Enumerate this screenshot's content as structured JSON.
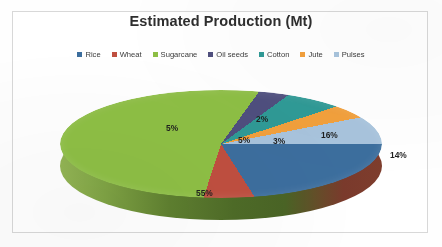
{
  "chart_data": {
    "type": "pie",
    "title": "Estimated Production (Mt)",
    "categories": [
      "Rice",
      "Wheat",
      "Sugarcane",
      "Oil seeds",
      "Cotton",
      "Jute",
      "Pulses"
    ],
    "values": [
      16,
      14,
      55,
      5,
      5,
      2,
      3
    ],
    "value_labels": [
      "16%",
      "14%",
      "55%",
      "5%",
      "5%",
      "2%",
      "3%"
    ],
    "unit": "%",
    "colors": [
      "#3c6e9e",
      "#bf4f40",
      "#8ebf45",
      "#4f4f7e",
      "#2f9a96",
      "#f2a03c",
      "#a8c4dd"
    ],
    "legend_position": "top",
    "three_d": true,
    "xlabel": "",
    "ylabel": "",
    "grid": false
  },
  "legend": {
    "items": [
      {
        "label": "Rice",
        "color": "#3c6e9e"
      },
      {
        "label": "Wheat",
        "color": "#bf4f40"
      },
      {
        "label": "Sugarcane",
        "color": "#8ebf45"
      },
      {
        "label": "Oil seeds",
        "color": "#4f4f7e"
      },
      {
        "label": "Cotton",
        "color": "#2f9a96"
      },
      {
        "label": "Jute",
        "color": "#f2a03c"
      },
      {
        "label": "Pulses",
        "color": "#a8c4dd"
      }
    ]
  },
  "slice_labels": [
    {
      "text": "16%",
      "left": "261px",
      "top": "40px"
    },
    {
      "text": "14%",
      "left": "330px",
      "top": "60px"
    },
    {
      "text": "55%",
      "left": "136px",
      "top": "98px"
    },
    {
      "text": "5%",
      "left": "106px",
      "top": "33px"
    },
    {
      "text": "5%",
      "left": "178px",
      "top": "45px"
    },
    {
      "text": "2%",
      "left": "196px",
      "top": "24px"
    },
    {
      "text": "3%",
      "left": "213px",
      "top": "46px"
    }
  ]
}
